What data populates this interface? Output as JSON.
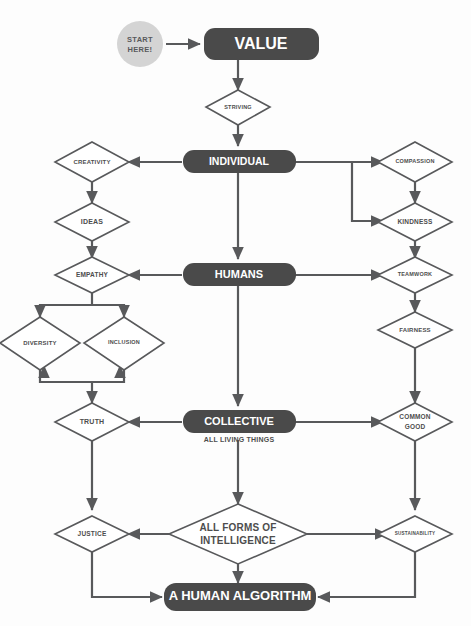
{
  "diagram": {
    "colors": {
      "box_fill": "#4a4a4a",
      "box_text": "#ffffff",
      "diamond_stroke": "#58595b",
      "diamond_fill": "#ffffff",
      "diamond_text": "#4d4d4d",
      "start_circle": "#d4d4d4",
      "connector": "#58595b",
      "background": "#fdfdfd"
    },
    "start": {
      "line1": "START",
      "line2": "HERE!"
    },
    "boxes": [
      {
        "id": "value",
        "label": "VALUE",
        "sub": ""
      },
      {
        "id": "individual",
        "label": "INDIVIDUAL",
        "sub": ""
      },
      {
        "id": "humans",
        "label": "HUMANS",
        "sub": ""
      },
      {
        "id": "collective",
        "label": "COLLECTIVE",
        "sub": "ALL LIVING THINGS"
      },
      {
        "id": "human_algorithm",
        "label": "A HUMAN ALGORITHM",
        "sub": ""
      }
    ],
    "diamonds": [
      {
        "id": "striving",
        "label": "STRIVING"
      },
      {
        "id": "creativity",
        "label": "CREATIVITY"
      },
      {
        "id": "ideas",
        "label": "IDEAS"
      },
      {
        "id": "empathy",
        "label": "EMPATHY"
      },
      {
        "id": "diversity",
        "label": "DIVERSITY"
      },
      {
        "id": "inclusion",
        "label": "INCLUSION"
      },
      {
        "id": "truth",
        "label": "TRUTH"
      },
      {
        "id": "justice",
        "label": "JUSTICE"
      },
      {
        "id": "compassion",
        "label": "COMPASSION"
      },
      {
        "id": "kindness",
        "label": "KINDNESS"
      },
      {
        "id": "teamwork",
        "label": "TEAMWORK"
      },
      {
        "id": "fairness",
        "label": "FAIRNESS"
      },
      {
        "id": "common_good",
        "label_line1": "COMMON",
        "label_line2": "GOOD"
      },
      {
        "id": "sustainability",
        "label": "SUSTAINABILITY"
      },
      {
        "id": "all_forms",
        "label_line1": "ALL FORMS OF",
        "label_line2": "INTELLIGENCE"
      }
    ],
    "flows": [
      "START HERE! -> VALUE",
      "VALUE -> STRIVING -> INDIVIDUAL",
      "INDIVIDUAL -> CREATIVITY -> IDEAS -> EMPATHY",
      "INDIVIDUAL -> COMPASSION -> KINDNESS -> TEAMWORK",
      "INDIVIDUAL -> KINDNESS",
      "INDIVIDUAL -> HUMANS",
      "HUMANS -> EMPATHY",
      "HUMANS -> TEAMWORK",
      "EMPATHY -> DIVERSITY & INCLUSION -> TRUTH",
      "TEAMWORK -> FAIRNESS -> COMMON GOOD",
      "HUMANS -> COLLECTIVE (ALL LIVING THINGS)",
      "COLLECTIVE -> TRUTH",
      "COLLECTIVE -> COMMON GOOD",
      "TRUTH -> JUSTICE",
      "COMMON GOOD -> SUSTAINABILITY",
      "COLLECTIVE -> ALL FORMS OF INTELLIGENCE",
      "ALL FORMS OF INTELLIGENCE -> JUSTICE",
      "ALL FORMS OF INTELLIGENCE -> SUSTAINABILITY",
      "JUSTICE -> A HUMAN ALGORITHM",
      "ALL FORMS OF INTELLIGENCE -> A HUMAN ALGORITHM",
      "SUSTAINABILITY -> A HUMAN ALGORITHM"
    ]
  }
}
